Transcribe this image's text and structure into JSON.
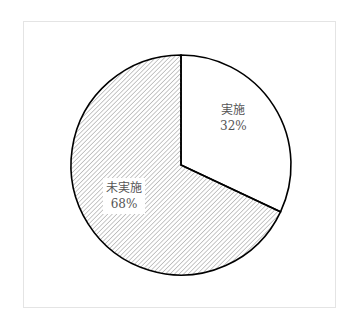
{
  "chart_data": {
    "type": "pie",
    "title": "",
    "categories": [
      "実施",
      "未実施"
    ],
    "values": [
      32,
      68
    ],
    "unit": "%",
    "start_angle": "12 o'clock",
    "direction": "clockwise",
    "series": [
      {
        "name": "実施",
        "value": 32,
        "label": "実施",
        "percent_label": "32%",
        "fill": "white"
      },
      {
        "name": "未実施",
        "value": 68,
        "label": "未実施",
        "percent_label": "68%",
        "fill": "diagonal-hatch"
      }
    ],
    "legend": "none (labels inside slices)"
  },
  "colors": {
    "outline": "#000000",
    "hatch": "#9a9a9a",
    "frame": "#e4e4e4",
    "label_text": "#555555"
  }
}
